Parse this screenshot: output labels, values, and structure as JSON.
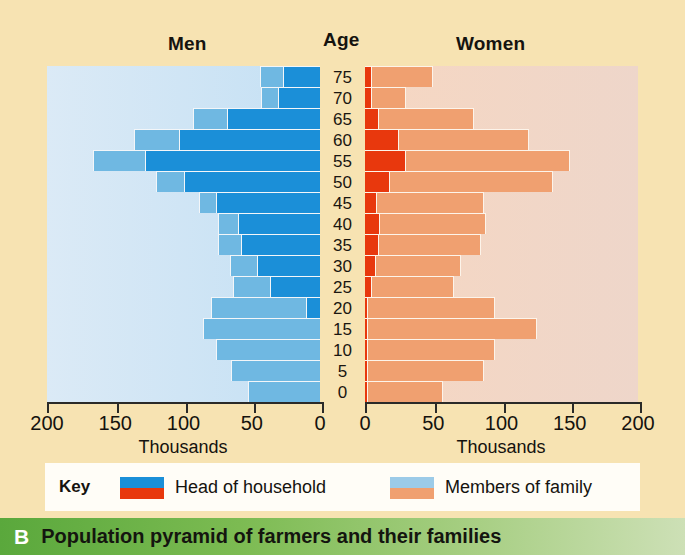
{
  "headers": {
    "men": "Men",
    "age": "Age",
    "women": "Women"
  },
  "axis": {
    "men_title": "Thousands",
    "women_title": "Thousands",
    "men_ticks": [
      "200",
      "150",
      "100",
      "50",
      "0"
    ],
    "women_ticks": [
      "0",
      "50",
      "100",
      "150",
      "200"
    ]
  },
  "key": {
    "title": "Key",
    "item1": "Head of household",
    "item2": "Members of family"
  },
  "caption": {
    "letter": "B",
    "text": "Population pyramid of farmers and their families"
  },
  "colors": {
    "men_head": "#1b8fd8",
    "men_family": "#6fb8e2",
    "women_head": "#e8380d",
    "women_family": "#f0a070",
    "panel_men": "#cfe4f5",
    "panel_women": "#f2d8c8",
    "card": "#f7e3b2",
    "caption_bar": "#5aa83c"
  },
  "chart_data": {
    "type": "bar",
    "title": "Population pyramid of farmers and their families",
    "subtype": "population-pyramid",
    "xlabel": "Thousands",
    "ylabel": "Age",
    "xlim": [
      0,
      200
    ],
    "xticks": [
      0,
      50,
      100,
      150,
      200
    ],
    "grid": false,
    "legend": [
      "Head of household",
      "Members of family"
    ],
    "legend_position": "bottom",
    "categories": [
      "75",
      "70",
      "65",
      "60",
      "55",
      "50",
      "45",
      "40",
      "35",
      "30",
      "25",
      "20",
      "15",
      "10",
      "5",
      "0"
    ],
    "series": [
      {
        "name": "Men - Head of household",
        "side": "left",
        "values": [
          27,
          31,
          68,
          103,
          128,
          100,
          76,
          60,
          58,
          46,
          37,
          10,
          0,
          0,
          0,
          0
        ]
      },
      {
        "name": "Men - Members of family",
        "side": "left",
        "values": [
          17,
          12,
          25,
          33,
          38,
          20,
          13,
          15,
          17,
          20,
          27,
          70,
          86,
          76,
          65,
          53
        ]
      },
      {
        "name": "Women - Head of household",
        "side": "right",
        "values": [
          5,
          5,
          10,
          25,
          30,
          18,
          9,
          11,
          10,
          8,
          5,
          0,
          0,
          0,
          0,
          0
        ]
      },
      {
        "name": "Women - Members of family",
        "side": "right",
        "values": [
          45,
          25,
          70,
          95,
          120,
          120,
          78,
          78,
          75,
          62,
          60,
          93,
          124,
          93,
          85,
          55
        ]
      }
    ],
    "totals_men": [
      44,
      43,
      93,
      136,
      166,
      120,
      89,
      75,
      75,
      66,
      64,
      80,
      86,
      76,
      65,
      53
    ],
    "totals_women": [
      50,
      30,
      80,
      120,
      150,
      138,
      87,
      89,
      85,
      70,
      65,
      93,
      124,
      93,
      85,
      55
    ]
  }
}
